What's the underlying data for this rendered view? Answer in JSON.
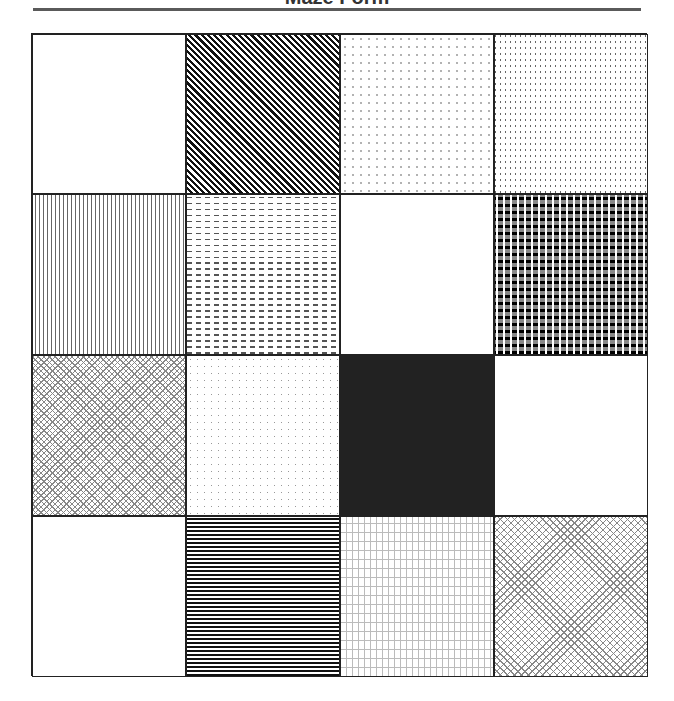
{
  "title": "Maze Form",
  "grid": {
    "rows": 4,
    "columns": 4,
    "cells": [
      {
        "row": 1,
        "col": 1,
        "pattern": "blank"
      },
      {
        "row": 1,
        "col": 2,
        "pattern": "diagonal-stripes"
      },
      {
        "row": 1,
        "col": 3,
        "pattern": "sparse-dots"
      },
      {
        "row": 1,
        "col": 4,
        "pattern": "vertical-dashes"
      },
      {
        "row": 2,
        "col": 1,
        "pattern": "vertical-lines"
      },
      {
        "row": 2,
        "col": 2,
        "pattern": "horizontal-dashes"
      },
      {
        "row": 2,
        "col": 3,
        "pattern": "blank"
      },
      {
        "row": 2,
        "col": 4,
        "pattern": "checkerboard"
      },
      {
        "row": 3,
        "col": 1,
        "pattern": "crosshatch"
      },
      {
        "row": 3,
        "col": 2,
        "pattern": "fine-dots"
      },
      {
        "row": 3,
        "col": 3,
        "pattern": "dark-weave"
      },
      {
        "row": 3,
        "col": 4,
        "pattern": "blank"
      },
      {
        "row": 4,
        "col": 1,
        "pattern": "blank"
      },
      {
        "row": 4,
        "col": 2,
        "pattern": "horizontal-lines"
      },
      {
        "row": 4,
        "col": 3,
        "pattern": "grid"
      },
      {
        "row": 4,
        "col": 4,
        "pattern": "crosshatch"
      }
    ]
  },
  "colors": {
    "border": "#222222",
    "rule": "#5a5a5a",
    "background": "#ffffff"
  }
}
